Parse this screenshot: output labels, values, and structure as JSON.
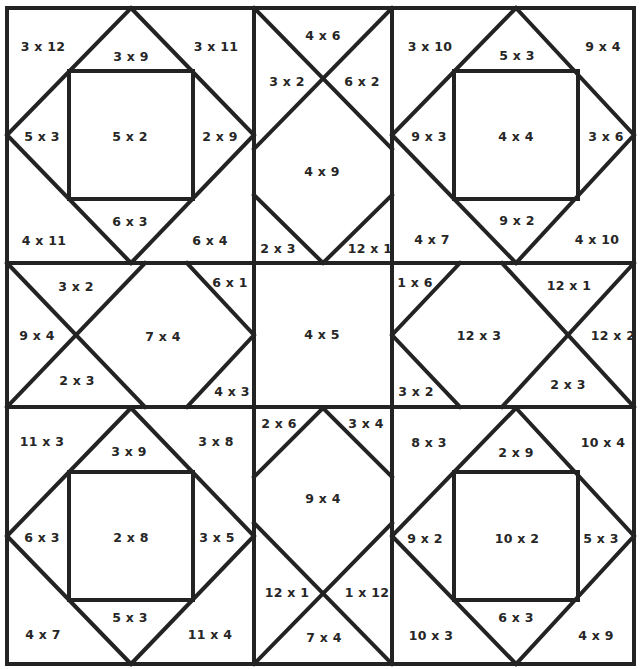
{
  "worksheet": {
    "type": "multiplication quilt coloring page",
    "line_color": "#232323",
    "text_color": "#262626",
    "background": "#ffffff"
  },
  "blocks": {
    "top_left": {
      "corner_tl": "3 x 12",
      "tri_top": "3 x 9",
      "corner_tr": "3 x 11",
      "tri_left": "5 x 3",
      "center": "5 x 2",
      "tri_right": "2 x 9",
      "corner_bl": "4 x 11",
      "tri_bottom": "6 x 3",
      "corner_br": "6 x 4"
    },
    "top_middle": {
      "top": "4 x 6",
      "left": "3 x 2",
      "right": "6 x 2",
      "center": "4 x 9",
      "bottom_left": "2 x 3",
      "bottom_right": "12 x 1"
    },
    "top_right": {
      "corner_tl": "3 x 10",
      "tri_top": "5 x 3",
      "corner_tr": "9 x 4",
      "tri_left": "9 x 3",
      "center": "4 x 4",
      "tri_right": "3 x 6",
      "corner_bl": "4 x 7",
      "tri_bottom": "9 x 2",
      "corner_br": "4 x 10"
    },
    "middle_left": {
      "top": "3 x 2",
      "left": "9 x 4",
      "bottom": "2 x 3",
      "center": "7 x 4",
      "top_right": "6 x 1",
      "bottom_right": "4 x 3"
    },
    "middle_center": {
      "center": "4 x 5"
    },
    "middle_right": {
      "top_left": "1 x 6",
      "bottom_left": "3 x 2",
      "center": "12 x 3",
      "top": "12 x 1",
      "right": "12 x 2",
      "bottom": "2 x 3"
    },
    "bottom_left": {
      "corner_tl": "11 x 3",
      "tri_top": "3 x 9",
      "corner_tr": "3 x 8",
      "tri_left": "6 x 3",
      "center": "2 x 8",
      "tri_right": "3 x 5",
      "corner_bl": "4 x 7",
      "tri_bottom": "5 x 3",
      "corner_br": "11 x 4"
    },
    "bottom_middle": {
      "top_left": "2 x 6",
      "top_right": "3 x 4",
      "center": "9 x 4",
      "left": "12 x 1",
      "right": "1 x 12",
      "bottom": "7 x 4"
    },
    "bottom_right": {
      "corner_tl": "8 x 3",
      "tri_top": "2 x 9",
      "corner_tr": "10 x 4",
      "tri_left": "9 x 2",
      "center": "10 x 2",
      "tri_right": "5 x 3",
      "corner_bl": "10 x 3",
      "tri_bottom": "6 x 3",
      "corner_br": "4 x 9"
    }
  }
}
